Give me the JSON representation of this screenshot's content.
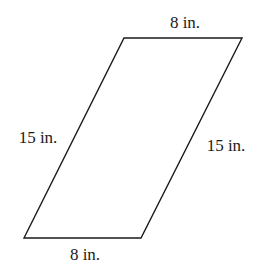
{
  "figure": {
    "shape": "parallelogram",
    "stroke_color": "#1a1a1a",
    "vertices": [
      [
        124,
        38
      ],
      [
        242,
        38
      ],
      [
        141,
        238
      ],
      [
        24,
        238
      ]
    ],
    "labels": {
      "top": "8 in.",
      "bottom": "8 in.",
      "left": "15 in.",
      "right": "15 in."
    }
  }
}
